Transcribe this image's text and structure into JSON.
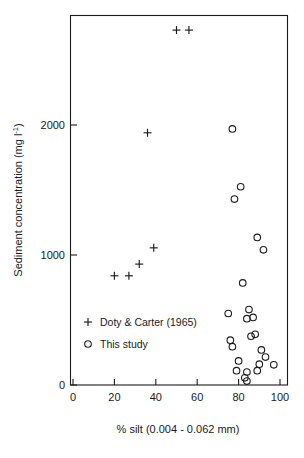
{
  "chart_data": {
    "type": "scatter",
    "title": "",
    "xlabel": "% silt (0.004 - 0.062 mm)",
    "ylabel": "Sediment concentration (mg l-1)",
    "ylabel_main": "Sediment concentration (mg l",
    "ylabel_sup": "-1",
    "ylabel_tail": ")",
    "xlim": [
      0,
      105
    ],
    "ylim": [
      0,
      2900
    ],
    "xticks": [
      0,
      20,
      40,
      60,
      80,
      100
    ],
    "xticklabels": [
      "0",
      "20",
      "40",
      "60",
      "80",
      "100"
    ],
    "yticks": [
      0,
      1000,
      2000
    ],
    "yticklabels": [
      "0",
      "1000",
      "2000"
    ],
    "grid": false,
    "legend_position": "inside-lower-left",
    "series": [
      {
        "name": "Doty & Carter (1965)",
        "marker": "plus",
        "points": [
          {
            "x": 50,
            "y": 2730
          },
          {
            "x": 56,
            "y": 2730
          },
          {
            "x": 36,
            "y": 1940
          },
          {
            "x": 39,
            "y": 1055
          },
          {
            "x": 32,
            "y": 930
          },
          {
            "x": 20,
            "y": 840
          },
          {
            "x": 27,
            "y": 840
          }
        ]
      },
      {
        "name": "This study",
        "marker": "circle",
        "points": [
          {
            "x": 77,
            "y": 1970
          },
          {
            "x": 81,
            "y": 1525
          },
          {
            "x": 78,
            "y": 1430
          },
          {
            "x": 89,
            "y": 1135
          },
          {
            "x": 92,
            "y": 1040
          },
          {
            "x": 82,
            "y": 785
          },
          {
            "x": 75,
            "y": 550
          },
          {
            "x": 85,
            "y": 580
          },
          {
            "x": 84,
            "y": 510
          },
          {
            "x": 87,
            "y": 520
          },
          {
            "x": 76,
            "y": 345
          },
          {
            "x": 86,
            "y": 375
          },
          {
            "x": 88,
            "y": 390
          },
          {
            "x": 77,
            "y": 295
          },
          {
            "x": 91,
            "y": 270
          },
          {
            "x": 80,
            "y": 185
          },
          {
            "x": 93,
            "y": 215
          },
          {
            "x": 90,
            "y": 160
          },
          {
            "x": 79,
            "y": 110
          },
          {
            "x": 84,
            "y": 100
          },
          {
            "x": 97,
            "y": 155
          },
          {
            "x": 89,
            "y": 110
          },
          {
            "x": 84,
            "y": 30
          },
          {
            "x": 83,
            "y": 55
          }
        ]
      }
    ]
  },
  "axes": {
    "x_title": "% silt (0.004 - 0.062 mm)",
    "y_title_main": "Sediment concentration (mg l",
    "y_title_sup": "-1",
    "y_title_tail": ")",
    "x_tick_0": "0",
    "x_tick_20": "20",
    "x_tick_40": "40",
    "x_tick_60": "60",
    "x_tick_80": "80",
    "x_tick_100": "100",
    "y_tick_0": "0",
    "y_tick_1000": "1000",
    "y_tick_2000": "2000"
  },
  "legend": {
    "entries": [
      {
        "label": "Doty & Carter (1965)",
        "marker": "plus-marker"
      },
      {
        "label": "This study",
        "marker": "circle-marker"
      }
    ]
  },
  "colors": {
    "ink": "#1b1b1b",
    "background": "#ffffff"
  }
}
